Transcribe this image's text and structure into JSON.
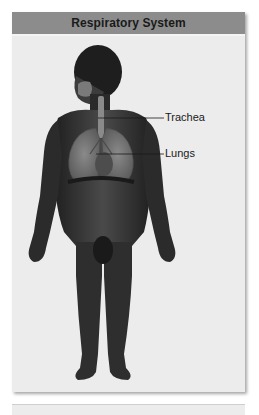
{
  "panel": {
    "title": "Respiratory System",
    "header_color": "#8c8c8c",
    "background_color": "#ececec"
  },
  "figure": {
    "skin_color": "#3a3a3a",
    "organ_color": "#6e6e6e",
    "labels": [
      {
        "text": "Trachea",
        "target": "trachea"
      },
      {
        "text": "Lungs",
        "target": "lungs"
      }
    ]
  }
}
